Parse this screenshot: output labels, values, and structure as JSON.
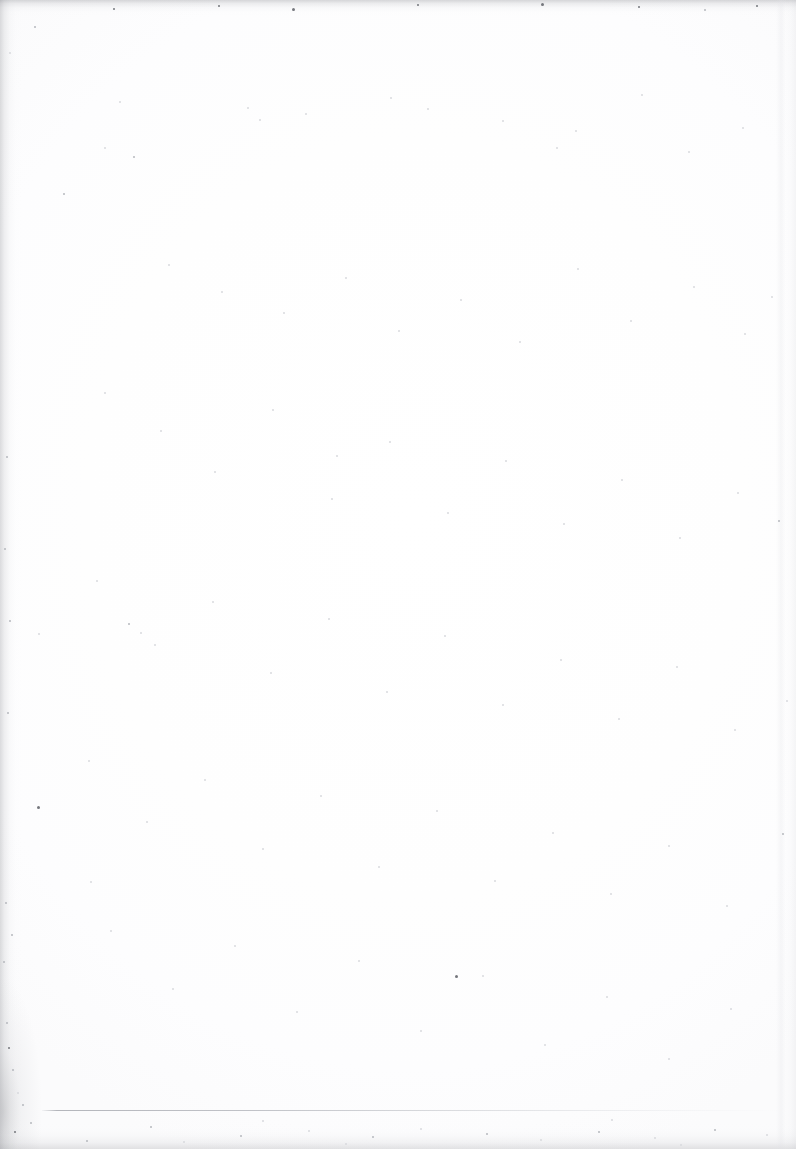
{
  "page": {
    "kind": "scanned-blank-page",
    "width_px": 796,
    "height_px": 1149,
    "text_content": "",
    "caption": "",
    "background_color": "#ffffff",
    "paper_tone_color": "#fdfdfe"
  },
  "artifacts": {
    "edge_shading": {
      "label": "scanner edge darkening",
      "color": "#7a7c82",
      "edges": [
        "top",
        "left",
        "bottom",
        "right"
      ]
    },
    "corner_smudge": {
      "label": "bottom-left corner smudge",
      "color": "#6e7076"
    },
    "right_streak": {
      "label": "right margin vertical streak",
      "color": "#e0e1e5"
    },
    "speckles": {
      "label": "dust and scan speckle noise",
      "colors": [
        "#d9dade",
        "#b6b8be",
        "#9a9ca2",
        "#75777d"
      ]
    }
  },
  "rule": {
    "label": "faint horizontal rule",
    "color": "#b0b2b8",
    "x_start_px": 42,
    "x_end_px": 780,
    "y_px": 1110,
    "thickness_px": 1
  },
  "speck_positions": [
    [
      63,
      193,
      2,
      "mid"
    ],
    [
      556,
      147,
      2,
      "faint"
    ],
    [
      292,
      8,
      3,
      "dark"
    ],
    [
      113,
      8,
      2,
      "dark"
    ],
    [
      218,
      5,
      2,
      "dark"
    ],
    [
      417,
      4,
      2,
      "dark"
    ],
    [
      541,
      3,
      3,
      "dark"
    ],
    [
      638,
      6,
      2,
      "dark"
    ],
    [
      704,
      9,
      2,
      "mid"
    ],
    [
      756,
      5,
      2,
      "dark"
    ],
    [
      34,
      26,
      2,
      "mid"
    ],
    [
      9,
      52,
      2,
      "faint"
    ],
    [
      37,
      806,
      3,
      "dark"
    ],
    [
      455,
      975,
      3,
      "dark"
    ],
    [
      336,
      455,
      2,
      "faint"
    ],
    [
      128,
      623,
      2,
      "mid"
    ],
    [
      140,
      632,
      2,
      "faint"
    ],
    [
      38,
      633,
      2,
      "faint"
    ],
    [
      90,
      881,
      2,
      "faint"
    ],
    [
      6,
      456,
      2,
      "mid"
    ],
    [
      4,
      548,
      2,
      "mid"
    ],
    [
      9,
      620,
      2,
      "mid"
    ],
    [
      7,
      712,
      2,
      "mid"
    ],
    [
      5,
      902,
      2,
      "mid"
    ],
    [
      11,
      934,
      2,
      "mid"
    ],
    [
      3,
      961,
      2,
      "mid"
    ],
    [
      6,
      1022,
      2,
      "mid"
    ],
    [
      8,
      1047,
      2,
      "dark"
    ],
    [
      12,
      1069,
      2,
      "mid"
    ],
    [
      17,
      1092,
      2,
      "faint"
    ],
    [
      22,
      1104,
      2,
      "mid"
    ],
    [
      30,
      1122,
      2,
      "mid"
    ],
    [
      14,
      1131,
      2,
      "dark"
    ],
    [
      240,
      1135,
      2,
      "mid"
    ],
    [
      308,
      1130,
      2,
      "faint"
    ],
    [
      372,
      1136,
      2,
      "mid"
    ],
    [
      420,
      1128,
      2,
      "faint"
    ],
    [
      486,
      1133,
      2,
      "mid"
    ],
    [
      540,
      1139,
      2,
      "faint"
    ],
    [
      598,
      1131,
      2,
      "mid"
    ],
    [
      654,
      1137,
      2,
      "faint"
    ],
    [
      714,
      1129,
      2,
      "mid"
    ],
    [
      766,
      1134,
      2,
      "faint"
    ],
    [
      150,
      1126,
      2,
      "mid"
    ],
    [
      86,
      1140,
      2,
      "mid"
    ],
    [
      183,
      1141,
      2,
      "faint"
    ],
    [
      262,
      1120,
      2,
      "faint"
    ],
    [
      345,
      1143,
      2,
      "faint"
    ],
    [
      611,
      1119,
      2,
      "faint"
    ],
    [
      680,
      1144,
      2,
      "faint"
    ],
    [
      119,
      101,
      2,
      "faint"
    ],
    [
      247,
      107,
      2,
      "faint"
    ],
    [
      259,
      119,
      2,
      "faint"
    ],
    [
      305,
      113,
      2,
      "faint"
    ],
    [
      390,
      97,
      2,
      "faint"
    ],
    [
      427,
      108,
      2,
      "faint"
    ],
    [
      502,
      120,
      2,
      "faint"
    ],
    [
      575,
      130,
      2,
      "faint"
    ],
    [
      641,
      94,
      2,
      "faint"
    ],
    [
      688,
      151,
      2,
      "faint"
    ],
    [
      742,
      127,
      2,
      "faint"
    ],
    [
      168,
      264,
      2,
      "faint"
    ],
    [
      221,
      291,
      2,
      "faint"
    ],
    [
      283,
      312,
      2,
      "faint"
    ],
    [
      345,
      277,
      2,
      "faint"
    ],
    [
      398,
      330,
      2,
      "faint"
    ],
    [
      460,
      299,
      2,
      "faint"
    ],
    [
      519,
      341,
      2,
      "faint"
    ],
    [
      577,
      268,
      2,
      "faint"
    ],
    [
      630,
      320,
      2,
      "faint"
    ],
    [
      693,
      286,
      2,
      "faint"
    ],
    [
      744,
      333,
      2,
      "faint"
    ],
    [
      104,
      392,
      2,
      "faint"
    ],
    [
      160,
      430,
      2,
      "faint"
    ],
    [
      214,
      471,
      2,
      "faint"
    ],
    [
      272,
      409,
      2,
      "faint"
    ],
    [
      331,
      498,
      2,
      "faint"
    ],
    [
      389,
      441,
      2,
      "faint"
    ],
    [
      447,
      512,
      2,
      "faint"
    ],
    [
      505,
      460,
      2,
      "faint"
    ],
    [
      563,
      523,
      2,
      "faint"
    ],
    [
      621,
      479,
      2,
      "faint"
    ],
    [
      679,
      537,
      2,
      "faint"
    ],
    [
      737,
      492,
      2,
      "faint"
    ],
    [
      96,
      580,
      2,
      "faint"
    ],
    [
      154,
      644,
      2,
      "faint"
    ],
    [
      212,
      601,
      2,
      "faint"
    ],
    [
      270,
      672,
      2,
      "faint"
    ],
    [
      328,
      618,
      2,
      "faint"
    ],
    [
      386,
      691,
      2,
      "faint"
    ],
    [
      444,
      635,
      2,
      "faint"
    ],
    [
      502,
      704,
      2,
      "faint"
    ],
    [
      560,
      659,
      2,
      "faint"
    ],
    [
      618,
      718,
      2,
      "faint"
    ],
    [
      676,
      666,
      2,
      "faint"
    ],
    [
      734,
      729,
      2,
      "faint"
    ],
    [
      88,
      760,
      2,
      "faint"
    ],
    [
      146,
      821,
      2,
      "faint"
    ],
    [
      204,
      779,
      2,
      "faint"
    ],
    [
      262,
      848,
      2,
      "faint"
    ],
    [
      320,
      795,
      2,
      "faint"
    ],
    [
      378,
      866,
      2,
      "faint"
    ],
    [
      436,
      810,
      2,
      "faint"
    ],
    [
      494,
      880,
      2,
      "faint"
    ],
    [
      552,
      832,
      2,
      "faint"
    ],
    [
      610,
      893,
      2,
      "faint"
    ],
    [
      668,
      845,
      2,
      "faint"
    ],
    [
      726,
      905,
      2,
      "faint"
    ],
    [
      110,
      930,
      2,
      "faint"
    ],
    [
      172,
      988,
      2,
      "faint"
    ],
    [
      234,
      945,
      2,
      "faint"
    ],
    [
      296,
      1011,
      2,
      "faint"
    ],
    [
      358,
      960,
      2,
      "faint"
    ],
    [
      420,
      1030,
      2,
      "faint"
    ],
    [
      482,
      975,
      2,
      "faint"
    ],
    [
      544,
      1044,
      2,
      "faint"
    ],
    [
      606,
      996,
      2,
      "faint"
    ],
    [
      668,
      1058,
      2,
      "faint"
    ],
    [
      730,
      1008,
      2,
      "faint"
    ],
    [
      133,
      156,
      2,
      "mid"
    ],
    [
      104,
      147,
      2,
      "faint"
    ],
    [
      778,
      520,
      2,
      "mid"
    ],
    [
      782,
      833,
      2,
      "mid"
    ],
    [
      771,
      296,
      2,
      "faint"
    ],
    [
      786,
      700,
      2,
      "faint"
    ]
  ]
}
